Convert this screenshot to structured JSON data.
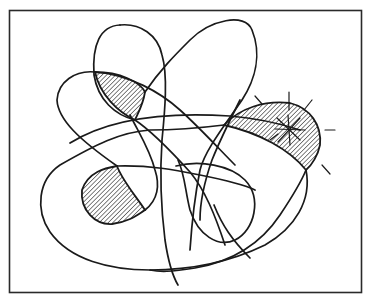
{
  "figure": {
    "frame": {
      "x": 9,
      "y": 10,
      "width": 353,
      "height": 283
    },
    "colors": {
      "ink": "#1a1a1a",
      "paper": "#ffffff",
      "frame": "#2a2a2a"
    },
    "hatched_regions": [
      {
        "id": "upper-left-lens"
      },
      {
        "id": "lower-left-blob"
      },
      {
        "id": "right-lens-starburst"
      }
    ],
    "caption": ""
  }
}
